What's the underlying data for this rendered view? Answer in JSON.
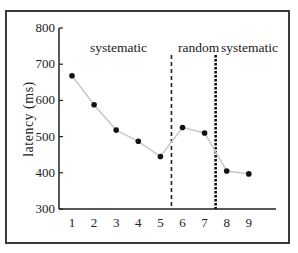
{
  "chart_data": {
    "type": "line",
    "title": "",
    "xlabel": "",
    "ylabel": "latency (ms)",
    "x": [
      1,
      2,
      3,
      4,
      5,
      6,
      7,
      8,
      9
    ],
    "categories": [
      "1",
      "2",
      "3",
      "4",
      "5",
      "6",
      "7",
      "8",
      "9"
    ],
    "series": [
      {
        "name": "latency",
        "values": [
          668,
          588,
          518,
          487,
          445,
          525,
          510,
          405,
          397
        ]
      }
    ],
    "ylim": [
      300,
      800
    ],
    "yticks": [
      "800",
      "700",
      "600",
      "500",
      "400",
      "300"
    ],
    "grid": false,
    "legend": "none",
    "annotations": [
      {
        "text": "systematic",
        "x_range": [
          1,
          5
        ]
      },
      {
        "text": "random",
        "x_range": [
          6,
          7
        ]
      },
      {
        "text": "systematic",
        "x_range": [
          8,
          9
        ]
      }
    ],
    "dividers": [
      {
        "at": 5.5,
        "style": "dashed"
      },
      {
        "at": 7.5,
        "style": "dotted-thick"
      }
    ],
    "colors": {
      "line": "#c8c8c8",
      "marker": "#111111",
      "axis": "#222222"
    }
  }
}
